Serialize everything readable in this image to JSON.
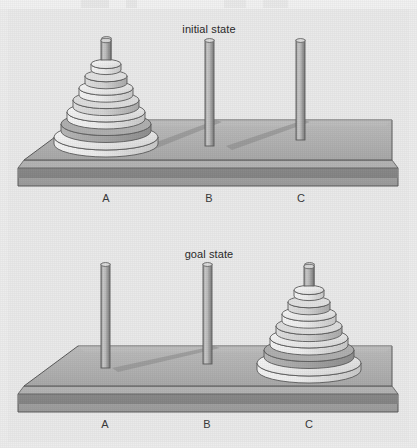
{
  "figure": {
    "title_visible": false,
    "panels": [
      {
        "id": "initial",
        "label": "initial state",
        "pegs": [
          {
            "name": "A",
            "label": "A",
            "disk_count": 7
          },
          {
            "name": "B",
            "label": "B",
            "disk_count": 0
          },
          {
            "name": "C",
            "label": "C",
            "disk_count": 0
          }
        ]
      },
      {
        "id": "goal",
        "label": "goal state",
        "pegs": [
          {
            "name": "A",
            "label": "A",
            "disk_count": 0
          },
          {
            "name": "B",
            "label": "B",
            "disk_count": 0
          },
          {
            "name": "C",
            "label": "C",
            "disk_count": 7
          }
        ]
      }
    ]
  },
  "colors": {
    "background": "#ededed",
    "base_top": "#b2b2b2",
    "base_side": "#9a9a9a",
    "base_band": "#8c8c8c",
    "outline": "#555555",
    "peg_light": "#cfcfcf",
    "peg_dark": "#8f8f8f",
    "disk_top_light": "#e8e8e8",
    "disk_rim_dark": "#8d8d8d",
    "shadow": "#8f8f8f",
    "text": "#2b2b2b"
  },
  "disks": {
    "note": "seven stacked disks, largest at bottom",
    "widths_px": [
      30,
      42,
      54,
      66,
      78,
      90,
      104
    ],
    "shades": [
      "#ededed",
      "#d9d9d9",
      "#ededed",
      "#d2d2d2",
      "#e6e6e6",
      "#a8a8a8",
      "#efefef"
    ]
  }
}
